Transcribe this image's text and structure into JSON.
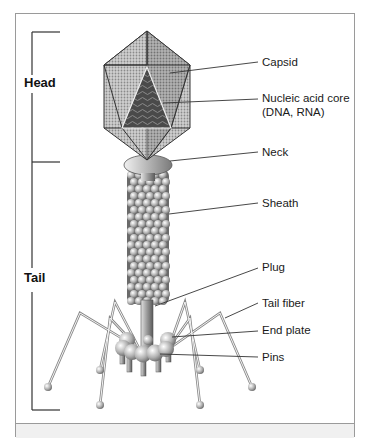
{
  "figure": {
    "sections": {
      "head": "Head",
      "tail": "Tail"
    },
    "labels": {
      "capsid": "Capsid",
      "nucleic_acid_core": "Nucleic acid core",
      "nucleic_acid_core_sub": "(DNA, RNA)",
      "neck": "Neck",
      "sheath": "Sheath",
      "plug": "Plug",
      "tail_fiber": "Tail fiber",
      "end_plate": "End plate",
      "pins": "Pins"
    },
    "colors": {
      "frame": "#9a9a9a",
      "capsid_light": "#d8d8d8",
      "capsid_dark": "#8c8c8c",
      "core": "#5a5a5a",
      "line": "#333333"
    }
  }
}
